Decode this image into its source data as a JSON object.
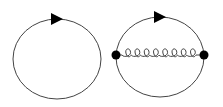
{
  "diagram": {
    "type": "feynman-diagrams",
    "colors": {
      "line": "#444444",
      "fill": "#000000",
      "background": "#ffffff"
    },
    "panels": [
      {
        "id": "fermion-loop",
        "label": "Fermion loop (one-loop)",
        "loop": {
          "cx": 57,
          "cy": 59,
          "rx": 44,
          "ry": 40
        },
        "arrow": {
          "x": 57,
          "y": 19,
          "direction": "right"
        },
        "vertices": [],
        "propagators": []
      },
      {
        "id": "fermion-loop-gluon-exchange",
        "label": "Fermion loop with gluon exchange (two-loop)",
        "loop": {
          "cx": 160,
          "cy": 59,
          "rx": 44,
          "ry": 40
        },
        "arrow": {
          "x": 160,
          "y": 19,
          "direction": "right"
        },
        "vertices": [
          {
            "x": 116,
            "y": 55
          },
          {
            "x": 204,
            "y": 55
          }
        ],
        "propagators": [
          {
            "kind": "gluon",
            "from": 0,
            "to": 1,
            "loops": 8
          }
        ]
      }
    ]
  }
}
